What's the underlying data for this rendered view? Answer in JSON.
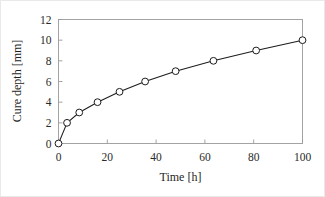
{
  "chart_data": {
    "type": "line",
    "title": "",
    "xlabel": "Time [h]",
    "ylabel": "Cure depth [mm]",
    "xlim": [
      0,
      100
    ],
    "ylim": [
      0,
      12
    ],
    "xticks": [
      0,
      20,
      40,
      60,
      80,
      100
    ],
    "yticks": [
      0,
      2,
      4,
      6,
      8,
      10,
      12
    ],
    "xtick_labels": [
      "0",
      "20",
      "40",
      "60",
      "80",
      "100"
    ],
    "ytick_labels": [
      "0",
      "2",
      "4",
      "6",
      "8",
      "10",
      "12"
    ],
    "grid": false,
    "legend": null,
    "series": [
      {
        "name": "Cure depth",
        "marker": "open-circle",
        "marker_color": "#ffffff",
        "line_color": "#1c1c1c",
        "x": [
          0,
          3.5,
          8.5,
          16,
          25,
          35.5,
          48,
          63.5,
          81,
          100
        ],
        "y": [
          0,
          2,
          3,
          4,
          5,
          6,
          7,
          8,
          9,
          10
        ]
      }
    ]
  },
  "figure": {
    "border_color": "#e9e9e9",
    "background": "#ffffff",
    "axis_color": "#9a9a9a",
    "data_color": "#1c1c1c"
  }
}
